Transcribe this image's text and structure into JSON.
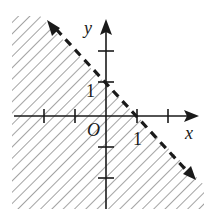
{
  "figure": {
    "x_axis_label": "x",
    "y_axis_label": "y",
    "origin_label": "O",
    "x_tick_label": "1",
    "y_tick_label": "1",
    "boundary": {
      "style": "dashed",
      "points": [
        [
          0,
          1
        ],
        [
          1,
          0
        ]
      ],
      "equation": "x + y = 1"
    },
    "shaded_region": "x + y < 1",
    "x_ticks": [
      -3,
      -2,
      -1,
      1,
      2
    ],
    "y_ticks": [
      -2,
      -1,
      1,
      2
    ],
    "colors": {
      "ink": "#1a1a1a",
      "hatch": "#555555",
      "background": "#ffffff"
    }
  }
}
